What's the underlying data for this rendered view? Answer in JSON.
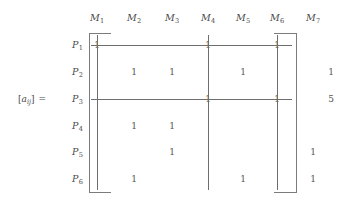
{
  "figure": {
    "label": {
      "open_bracket": "[",
      "symbol": "a",
      "subscript": "ij",
      "close_bracket": "]",
      "equals": "="
    },
    "columns": [
      {
        "base": "M",
        "sub": "1"
      },
      {
        "base": "M",
        "sub": "2"
      },
      {
        "base": "M",
        "sub": "3"
      },
      {
        "base": "M",
        "sub": "4"
      },
      {
        "base": "M",
        "sub": "5"
      },
      {
        "base": "M",
        "sub": "6"
      },
      {
        "base": "M",
        "sub": "7"
      }
    ],
    "rows": [
      {
        "base": "P",
        "sub": "1"
      },
      {
        "base": "P",
        "sub": "2"
      },
      {
        "base": "P",
        "sub": "3"
      },
      {
        "base": "P",
        "sub": "4"
      },
      {
        "base": "P",
        "sub": "5"
      },
      {
        "base": "P",
        "sub": "6"
      }
    ],
    "entries": [
      {
        "row": 0,
        "col": 0,
        "value": "1"
      },
      {
        "row": 0,
        "col": 3,
        "value": "1"
      },
      {
        "row": 0,
        "col": 5,
        "value": "1"
      },
      {
        "row": 1,
        "col": 1,
        "value": "1"
      },
      {
        "row": 1,
        "col": 2,
        "value": "1"
      },
      {
        "row": 1,
        "col": 4,
        "value": "1"
      },
      {
        "row": 2,
        "col": 3,
        "value": "1"
      },
      {
        "row": 2,
        "col": 5,
        "value": "1"
      },
      {
        "row": 3,
        "col": 1,
        "value": "1"
      },
      {
        "row": 3,
        "col": 2,
        "value": "1"
      },
      {
        "row": 4,
        "col": 2,
        "value": "1"
      },
      {
        "row": 4,
        "col": 6,
        "value": "1"
      },
      {
        "row": 5,
        "col": 1,
        "value": "1"
      },
      {
        "row": 5,
        "col": 4,
        "value": "1"
      },
      {
        "row": 5,
        "col": 6,
        "value": "1"
      }
    ],
    "annotations": [
      {
        "row": 1,
        "value": "1"
      },
      {
        "row": 2,
        "value": "5"
      }
    ],
    "cover_lines": {
      "vertical_columns": [
        0,
        3,
        5
      ],
      "horizontal_rows": [
        0,
        2
      ]
    },
    "colors": {
      "text": "#4a4a4a",
      "entry": "#555555",
      "bracket": "#7c7c7c",
      "cover": "#6e6e6e",
      "background": "#ffffff"
    }
  }
}
